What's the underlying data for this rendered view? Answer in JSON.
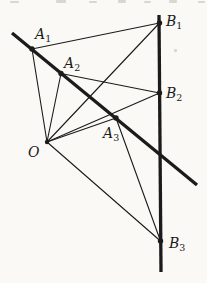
{
  "figure": {
    "canvas": {
      "width": 207,
      "height": 283
    },
    "colors": {
      "background": "#faf9f6",
      "ink": "#1b1b1b",
      "artifact": "#bdbbb4"
    },
    "stroke": {
      "thick": 3.3,
      "thin": 1.1,
      "dot_radius": 2.7,
      "center_dot_radius": 2.2
    },
    "points": {
      "O": {
        "x": 47,
        "y": 142,
        "dot": true,
        "label": {
          "main": "O",
          "sub": "",
          "x": 28,
          "y": 157
        }
      },
      "A1": {
        "x": 32,
        "y": 49,
        "dot": true,
        "label": {
          "main": "A",
          "sub": "1",
          "x": 35,
          "y": 39
        }
      },
      "A2": {
        "x": 61,
        "y": 73.5,
        "dot": true,
        "label": {
          "main": "A",
          "sub": "2",
          "x": 64,
          "y": 68
        }
      },
      "A3": {
        "x": 116,
        "y": 118,
        "dot": true,
        "label": {
          "main": "A",
          "sub": "3",
          "x": 103,
          "y": 138
        }
      },
      "B1": {
        "x": 159.5,
        "y": 23,
        "dot": true,
        "label": {
          "main": "B",
          "sub": "1",
          "x": 166,
          "y": 26
        }
      },
      "B2": {
        "x": 159.5,
        "y": 93,
        "dot": true,
        "label": {
          "main": "B",
          "sub": "2",
          "x": 166,
          "y": 98
        }
      },
      "B3": {
        "x": 160.5,
        "y": 241,
        "dot": true,
        "label": {
          "main": "B",
          "sub": "3",
          "x": 169,
          "y": 248
        }
      }
    },
    "thick_lines": [
      {
        "name": "line-through-A-points",
        "x1": 12,
        "y1": 33,
        "x2": 197,
        "y2": 185
      },
      {
        "name": "line-through-B-points",
        "x1": 159,
        "y1": 15,
        "x2": 161,
        "y2": 272
      }
    ],
    "thin_segments": [
      {
        "name": "segment-O-A1",
        "from": "O",
        "to": "A1"
      },
      {
        "name": "segment-O-A2",
        "from": "O",
        "to": "A2"
      },
      {
        "name": "segment-O-A3",
        "from": "O",
        "to": "A3"
      },
      {
        "name": "segment-O-B1",
        "from": "O",
        "to": "B1"
      },
      {
        "name": "segment-O-B2",
        "from": "O",
        "to": "B2"
      },
      {
        "name": "segment-O-B3",
        "from": "O",
        "to": "B3"
      },
      {
        "name": "segment-A1-B1",
        "from": "A1",
        "to": "B1"
      },
      {
        "name": "segment-A2-B2",
        "from": "A2",
        "to": "B2"
      },
      {
        "name": "segment-A3-B3",
        "from": "A3",
        "to": "B3"
      }
    ],
    "artifacts": [
      {
        "x": 10,
        "y": 1,
        "w": 9,
        "h": 2
      },
      {
        "x": 56,
        "y": 0,
        "w": 10,
        "h": 3
      },
      {
        "x": 89,
        "y": 1,
        "w": 8,
        "h": 2
      },
      {
        "x": 118,
        "y": 0,
        "w": 8,
        "h": 3
      },
      {
        "x": 144,
        "y": 1,
        "w": 7,
        "h": 2
      },
      {
        "x": 169,
        "y": 0,
        "w": 8,
        "h": 3
      },
      {
        "x": 198,
        "y": 1,
        "w": 7,
        "h": 2
      },
      {
        "x": 174,
        "y": 49,
        "w": 3,
        "h": 3
      }
    ]
  }
}
